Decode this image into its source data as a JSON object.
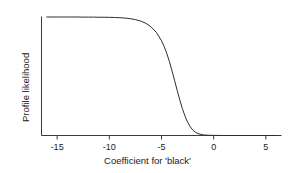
{
  "chart_data": {
    "type": "line",
    "title": "",
    "xlabel": "Coefficient for 'black'",
    "ylabel": "Profile likelihood",
    "xlim": [
      -16.5,
      6.5
    ],
    "ylim": [
      0,
      1.08
    ],
    "xticks": [
      -15,
      -10,
      -5,
      0,
      5
    ],
    "xticklabels": [
      "-15",
      "-10",
      "-5",
      "0",
      "5"
    ],
    "yticks": [],
    "yticklabels": [],
    "grid": false,
    "legend": false,
    "series": [
      {
        "name": "Profile likelihood",
        "color": "#2e2e2e",
        "x": [
          -16.0,
          -15.5,
          -15.0,
          -14.5,
          -14.0,
          -13.5,
          -13.0,
          -12.5,
          -12.0,
          -11.5,
          -11.0,
          -10.5,
          -10.0,
          -9.5,
          -9.0,
          -8.5,
          -8.0,
          -7.5,
          -7.0,
          -6.5,
          -6.0,
          -5.5,
          -5.0,
          -4.75,
          -4.5,
          -4.25,
          -4.0,
          -3.75,
          -3.5,
          -3.25,
          -3.0,
          -2.75,
          -2.5,
          -2.25,
          -2.0,
          -1.75,
          -1.5,
          -1.0,
          -0.5,
          0.0,
          1.0,
          2.0,
          3.0,
          4.0,
          5.0,
          6.0
        ],
        "y": [
          1.0,
          1.0,
          1.0,
          1.0,
          1.0,
          1.0,
          1.0,
          0.999,
          0.999,
          0.999,
          0.998,
          0.998,
          0.997,
          0.996,
          0.994,
          0.991,
          0.986,
          0.978,
          0.966,
          0.947,
          0.917,
          0.871,
          0.8,
          0.752,
          0.694,
          0.626,
          0.549,
          0.466,
          0.382,
          0.301,
          0.227,
          0.164,
          0.113,
          0.074,
          0.046,
          0.027,
          0.016,
          0.005,
          0.002,
          0.001,
          0.0,
          0.0,
          0.0,
          0.0,
          0.0,
          0.0
        ]
      }
    ],
    "annotations": []
  },
  "axes": {
    "x_tick_labels": [
      "-15",
      "-10",
      "-5",
      "0",
      "5"
    ],
    "x_axis_title": "Coefficient for 'black'",
    "y_axis_title": "Profile likelihood"
  },
  "colors": {
    "curve": "#2e2e2e",
    "axis": "#3b3b3b",
    "background": "#ffffff",
    "text": "#1a1a1a"
  }
}
